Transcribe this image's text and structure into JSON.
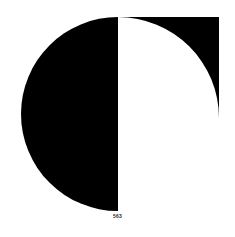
{
  "page": {
    "background_color": "#ffffff",
    "ink_color": "#000000",
    "page_number": "563",
    "page_number_color": "#2b2b2b",
    "width": 235,
    "height": 237
  },
  "figure": {
    "name": "half-disc-and-quarter-cut-square",
    "shapes": [
      {
        "name": "black-half-disc",
        "type": "semicircle",
        "fill": "#000000",
        "center_x": 118,
        "center_y": 114,
        "radius": 97,
        "flat_edge": "right",
        "flat_edge_x": 118,
        "top_y": 17,
        "bottom_y": 211,
        "left_x": 21
      },
      {
        "name": "black-square-with-quarter-circle-cut",
        "type": "square-minus-quarter-circle",
        "fill": "#000000",
        "left_x": 118,
        "top_y": 17,
        "right_x": 219,
        "bottom_y": 118,
        "side": 101,
        "cut": {
          "name": "white-quarter-circle",
          "fill": "#ffffff",
          "center_x": 219,
          "center_y": 17,
          "radius": 101,
          "quadrant": "lower-left"
        }
      }
    ]
  }
}
